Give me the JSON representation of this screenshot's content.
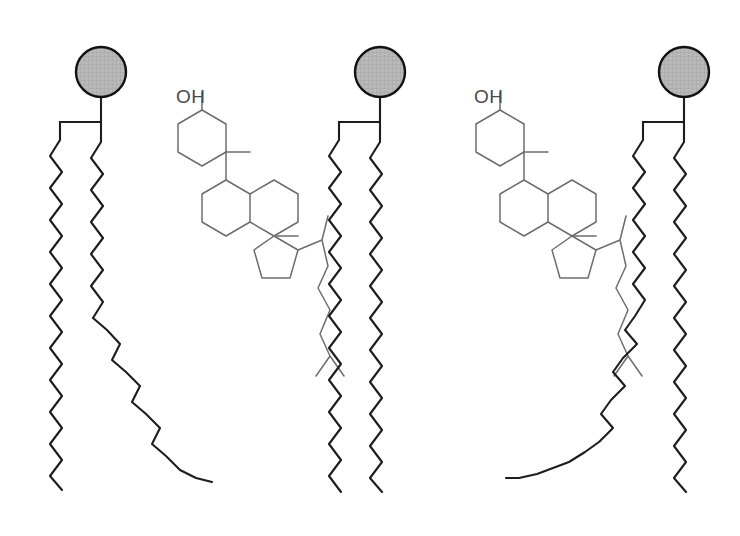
{
  "figure": {
    "background_color": "#ffffff",
    "width": 740,
    "height": 536
  },
  "style": {
    "lipid_stroke_color": "#1d1d1d",
    "lipid_stroke_width": 2.1,
    "sterol_stroke_color": "#6d6d6d",
    "sterol_stroke_width": 1.5,
    "head_fill_color": "#b4b4b4",
    "head_outline_color": "#111111",
    "label_color": "#4a4a4a"
  },
  "molecules": [
    {
      "id": "phospholipid-1",
      "type": "phospholipid",
      "name": "Unsaturated phospholipid",
      "head": {
        "name": "polar-head-group",
        "cx": 101,
        "cy": 72,
        "r": 25
      },
      "stem": "M101,97 L101,122 M101,122 L60,122 L60,140 M101,122 L101,142",
      "tails": [
        {
          "name": "saturated-tail",
          "saturation": "saturated",
          "path": "M60,140 L50,156 L62,172 L50,188 L62,204 L50,220 L62,236 L50,252 L62,268 L50,284 L62,300 L50,316 L62,332 L50,348 L62,364 L50,380 L62,396 L50,412 L62,428 L50,444 L62,460 L50,476 L62,490"
        },
        {
          "name": "unsaturated-kinked-tail",
          "saturation": "unsaturated",
          "path": "M101,142 L91,158 L103,174 L91,190 L103,206 L91,222 L103,238 L91,254 L103,270 L91,286 L103,302 L93,318 L107,330 L120,344 L112,360 L126,372 L140,386 L132,402 L146,414 L160,428 L152,444 L166,456 L180,470 L196,478 L212,482"
        }
      ]
    },
    {
      "id": "cholesterol-1",
      "type": "cholesterol",
      "name": "Cholesterol",
      "hydroxyl_label": "OH",
      "label_pos": {
        "x": 176,
        "y": 103
      },
      "origin": {
        "x": 178,
        "y": 88
      }
    },
    {
      "id": "phospholipid-2",
      "type": "phospholipid",
      "name": "Saturated phospholipid",
      "head": {
        "name": "polar-head-group",
        "cx": 380,
        "cy": 72,
        "r": 25
      },
      "stem": "M380,97 L380,122 M380,122 L339,122 L339,140 M380,122 L380,142",
      "tails": [
        {
          "name": "saturated-tail-left",
          "saturation": "saturated",
          "path": "M339,140 L329,156 L341,172 L329,188 L341,204 L329,220 L341,236 L329,252 L341,268 L329,284 L341,300 L329,316 L341,332 L329,348 L341,364 L329,380 L341,396 L329,412 L341,428 L329,444 L341,460 L329,476 L341,492"
        },
        {
          "name": "saturated-tail-right",
          "saturation": "saturated",
          "path": "M380,142 L370,158 L382,174 L370,190 L382,206 L370,222 L382,238 L370,254 L382,270 L370,286 L382,302 L370,318 L382,334 L370,350 L382,366 L370,382 L382,398 L370,414 L382,430 L370,446 L382,462 L370,478 L382,492"
        }
      ]
    },
    {
      "id": "cholesterol-2",
      "type": "cholesterol",
      "name": "Cholesterol",
      "hydroxyl_label": "OH",
      "label_pos": {
        "x": 474,
        "y": 103
      },
      "origin": {
        "x": 476,
        "y": 88
      }
    },
    {
      "id": "phospholipid-3",
      "type": "phospholipid",
      "name": "Unsaturated phospholipid",
      "head": {
        "name": "polar-head-group",
        "cx": 684,
        "cy": 72,
        "r": 25
      },
      "stem": "M684,97 L684,122 M684,122 L643,122 L643,140 M684,122 L684,142",
      "tails": [
        {
          "name": "unsaturated-kinked-tail",
          "saturation": "unsaturated",
          "path": "M643,140 L633,156 L645,172 L633,188 L645,204 L633,220 L645,236 L633,252 L645,268 L633,284 L645,300 L635,316 L625,330 L637,344 L623,358 L613,372 L625,386 L611,400 L601,414 L613,428 L599,442 L585,452 L569,462 L553,468 L537,474 L519,478 L506,478"
        },
        {
          "name": "saturated-tail",
          "saturation": "saturated",
          "path": "M684,142 L674,158 L686,174 L674,190 L686,206 L674,222 L686,238 L674,254 L686,270 L674,286 L686,302 L674,318 L686,334 L674,350 L686,366 L674,382 L686,398 L674,414 L686,430 L674,446 L686,462 L674,478 L686,492"
        }
      ]
    }
  ],
  "cholesterol_skeleton": {
    "description": "Steroid nucleus: three fused six-membered rings (A, B, C) and one five-membered ring (D), with a C3 hydroxyl and a branched isooctyl side chain.",
    "rings": [
      {
        "name": "ring-a",
        "path": "M24,22 L0,36 L0,64 L24,78 L48,64 L48,36 Z"
      },
      {
        "name": "ring-b",
        "path": "M48,64 L48,92 L24,106 L24,134 L48,148 L72,134 L72,106 Z"
      },
      {
        "name": "ring-c",
        "path": "M72,106 L96,92 L120,106 L120,134 L96,148 L72,134 Z"
      },
      {
        "name": "ring-d",
        "path": "M96,148 L120,162 L112,190 L84,190 L76,162 Z"
      }
    ],
    "hydroxyl_bond": "M24,22 L24,4",
    "methyl_c10": "M48,64 L72,64",
    "methyl_c13": "M96,148 L120,148",
    "side_chain": "M120,162 L144,152 L150,128 M144,152 L150,178 L140,200 L152,222 L142,246 L152,268 M152,268 L138,288 M152,268 L166,288"
  }
}
